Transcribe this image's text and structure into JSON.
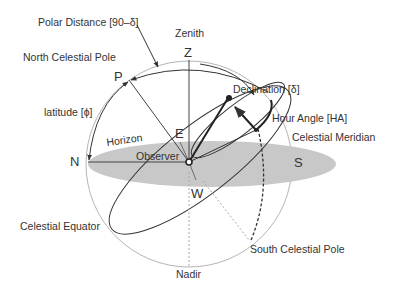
{
  "diagram": {
    "labels": {
      "polar_distance": "Polar Distance [90–δ]",
      "zenith": "Zenith",
      "north_celestial_pole": "North Celestial Pole",
      "latitude": "latitude [ϕ]",
      "horizon": "Horizon",
      "observer": "Observer",
      "declination": "Declination [δ]",
      "hour_angle": "Hour Angle [HA]",
      "celestial_meridian": "Celestial Meridian",
      "celestial_equator": "Celestial Equator",
      "south_celestial_pole": "South Celestial Pole",
      "nadir": "Nadir"
    },
    "points": {
      "Z": "Z",
      "P": "P",
      "E": "E",
      "N": "N",
      "S": "S",
      "W": "W"
    },
    "colors": {
      "horizon_fill": "#c8c8c8",
      "sphere_outline": "#b5b5b5",
      "line": "#333333",
      "text": "#333333",
      "dashed": "#aaaaaa"
    }
  }
}
